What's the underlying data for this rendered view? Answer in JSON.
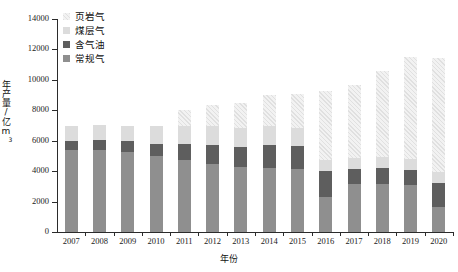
{
  "chart_data": {
    "type": "bar",
    "title": "",
    "subtitle": "",
    "xlabel": "年份",
    "ylabel": "年产量/亿m³",
    "ylim": [
      0,
      14000
    ],
    "ytick_values": [
      0,
      2000,
      4000,
      6000,
      8000,
      10000,
      12000,
      14000
    ],
    "ytick_labels": [
      "0",
      "2000",
      "4000",
      "6000",
      "8000",
      "10000",
      "12000",
      "14000"
    ],
    "grid": false,
    "stacked": true,
    "legend_position": "top-left",
    "categories": [
      "2007",
      "2008",
      "2009",
      "2010",
      "2011",
      "2012",
      "2013",
      "2014",
      "2015",
      "2016",
      "2017",
      "2018",
      "2019",
      "2020"
    ],
    "series": [
      {
        "name": "常规气",
        "color": "#8f8f8f",
        "values": [
          5400,
          5400,
          5250,
          5000,
          4700,
          4500,
          4250,
          4200,
          4150,
          2300,
          3150,
          3150,
          3100,
          1650
        ]
      },
      {
        "name": "含气油",
        "color": "#5e5e5e",
        "values": [
          600,
          650,
          700,
          800,
          1100,
          1250,
          1350,
          1500,
          1500,
          1700,
          1000,
          1050,
          1000,
          1600
        ]
      },
      {
        "name": "煤层气",
        "color": "#dcdcdc",
        "values": [
          950,
          1000,
          1050,
          1200,
          1150,
          1200,
          1250,
          1250,
          1200,
          700,
          700,
          700,
          700,
          700
        ]
      },
      {
        "name": "页岩气",
        "color": "#e8e8e8",
        "hatch": "diagonal",
        "values": [
          0,
          0,
          0,
          0,
          1100,
          1400,
          1600,
          2050,
          2200,
          4600,
          4800,
          5700,
          6700,
          7500
        ]
      }
    ],
    "totals": [
      6950,
      7050,
      7000,
      7000,
      8050,
      8350,
      8450,
      9000,
      9050,
      9300,
      9650,
      10600,
      11500,
      11450
    ]
  },
  "legend": {
    "items": [
      {
        "label": "页岩气",
        "swatch_name": "legend-swatch-shale"
      },
      {
        "label": "煤层气",
        "swatch_name": "legend-swatch-cbm"
      },
      {
        "label": "含气油",
        "swatch_name": "legend-swatch-tight"
      },
      {
        "label": "常规气",
        "swatch_name": "legend-swatch-conventional"
      }
    ]
  },
  "axes": {
    "x_title": "年份",
    "y_title_main": "年产量/亿m",
    "y_title_sup": "3"
  }
}
